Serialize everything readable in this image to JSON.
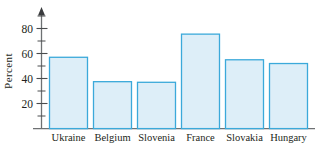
{
  "chart_data": {
    "type": "bar",
    "title": "",
    "subtitle": "",
    "xlabel": "",
    "ylabel": "Percent",
    "categories": [
      "Ukraine",
      "Belgium",
      "Slovenia",
      "France",
      "Slovakia",
      "Hungary"
    ],
    "values": [
      57,
      37.5,
      37,
      75.5,
      55,
      52
    ],
    "ylim": [
      0,
      90
    ],
    "ytick_labels": [
      "20",
      "40",
      "60",
      "80"
    ],
    "ytick_values": [
      20,
      40,
      60,
      80
    ],
    "yminor_tick_values": [
      10,
      30,
      50,
      70,
      90
    ],
    "grid": false,
    "legend": null,
    "legend_position": "none",
    "annotations": [],
    "bar_fill_color": "#ddeef8",
    "bar_border_color": "#3ba9da",
    "axis_color": "#6e7173",
    "text_color": "#231f20",
    "y_axis_arrow": true
  },
  "axis": {
    "ylabel": "Percent"
  }
}
